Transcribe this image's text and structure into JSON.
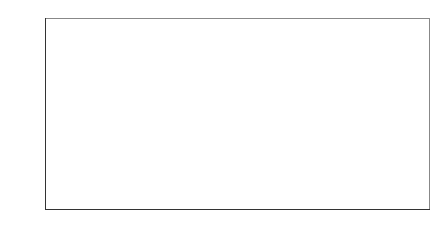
{
  "chart_data": {
    "type": "bar",
    "title": "",
    "xlabel": "",
    "ylabel": "Billion Yuan",
    "ylim": [
      0,
      2000
    ],
    "yticks": [
      0,
      200,
      400,
      600,
      800,
      1000,
      1200,
      1400,
      1600,
      1800,
      2000
    ],
    "grid": false,
    "legend": null,
    "categories": [
      "Jan-08",
      "Feb-08",
      "Mar-08",
      "Apr-08",
      "May-08",
      "Jun-08",
      "Jul-08",
      "Aug-08",
      "Sep-08",
      "Oct-08",
      "Nov-08",
      "Dec-08",
      "Jan-09",
      "Feb-09",
      "Mar-09",
      "Apr-09",
      "May-09",
      "Jun-09"
    ],
    "category_lines": [
      [
        "Jan-",
        "08"
      ],
      [
        "Feb-",
        "08"
      ],
      [
        "Mar-",
        "08"
      ],
      [
        "Apr-",
        "08"
      ],
      [
        "May-",
        "08"
      ],
      [
        "Jun-",
        "08"
      ],
      [
        "Jul-",
        "08"
      ],
      [
        "Aug-",
        "08"
      ],
      [
        "Sep-",
        "08"
      ],
      [
        "Oct-",
        "08"
      ],
      [
        "Nov-",
        "08"
      ],
      [
        "Dec-",
        "08"
      ],
      [
        "Jan-",
        "09"
      ],
      [
        "Feb-",
        "09"
      ],
      [
        "Mar-",
        "09"
      ],
      [
        "Apr-",
        "09"
      ],
      [
        "May-",
        "09"
      ],
      [
        "Jun-",
        "09"
      ]
    ],
    "values": [
      900,
      390,
      350,
      490,
      320,
      320,
      380,
      275,
      375,
      185,
      475,
      770,
      1600,
      1560,
      1865,
      590,
      1600,
      1755
    ],
    "bar_color": "#bdbdbd",
    "bar_edge_color": "#333333"
  }
}
